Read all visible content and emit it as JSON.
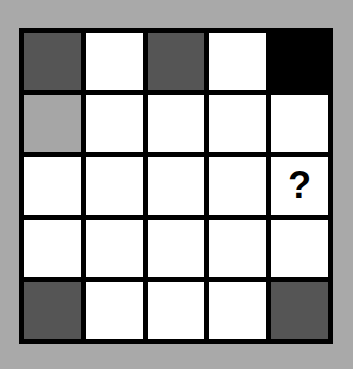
{
  "puzzle": {
    "rows": 5,
    "cols": 5,
    "colors": {
      "background": "#a9a9a9",
      "border": "#000000",
      "white": "#ffffff",
      "dark": "#555555",
      "light": "#a6a6a6",
      "black": "#000000"
    },
    "cells": [
      [
        "dark",
        "white",
        "dark",
        "white",
        "black"
      ],
      [
        "light",
        "white",
        "white",
        "white",
        "white"
      ],
      [
        "white",
        "white",
        "white",
        "white",
        "question"
      ],
      [
        "white",
        "white",
        "white",
        "white",
        "white"
      ],
      [
        "dark",
        "white",
        "white",
        "white",
        "dark"
      ]
    ],
    "question_mark": "?"
  }
}
